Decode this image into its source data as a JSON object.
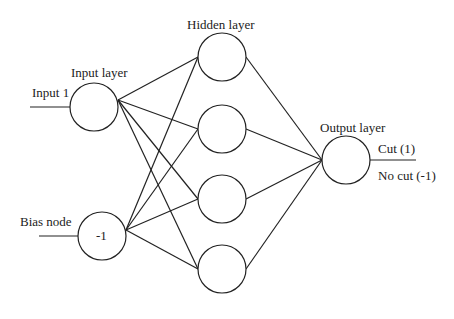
{
  "labels": {
    "hidden_layer": "Hidden layer",
    "input_layer": "Input layer",
    "input_1": "Input 1",
    "output_layer": "Output layer",
    "cut": "Cut (1)",
    "no_cut": "No cut (-1)",
    "bias_node": "Bias node",
    "bias_value": "-1"
  },
  "nodes": {
    "input": [
      {
        "id": "input-1",
        "cx": 94,
        "cy": 107
      }
    ],
    "bias": {
      "id": "bias",
      "cx": 102,
      "cy": 236
    },
    "hidden": [
      {
        "id": "h1",
        "cx": 222,
        "cy": 57
      },
      {
        "id": "h2",
        "cx": 222,
        "cy": 129
      },
      {
        "id": "h3",
        "cx": 222,
        "cy": 199
      },
      {
        "id": "h4",
        "cx": 222,
        "cy": 269
      }
    ],
    "output": {
      "id": "output",
      "cx": 346,
      "cy": 160
    },
    "radius": 24
  },
  "colors": {
    "stroke": "#222222",
    "background": "#ffffff"
  }
}
